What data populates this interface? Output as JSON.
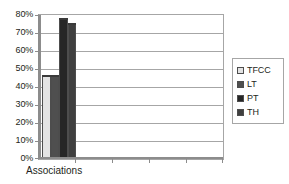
{
  "chart_data": {
    "type": "bar",
    "title": "",
    "subtitle": "",
    "xlabel": "Associations",
    "ylabel": "",
    "categories": [
      "Associations"
    ],
    "series": [
      {
        "name": "TFCC",
        "values": [
          47
        ],
        "color": "#e3e3e3"
      },
      {
        "name": "LT",
        "values": [
          47
        ],
        "color": "#4f4f4f"
      },
      {
        "name": "PT",
        "values": [
          79
        ],
        "color": "#262626"
      },
      {
        "name": "TH",
        "values": [
          76
        ],
        "color": "#3f3f3f"
      }
    ],
    "ylim": [
      0,
      80
    ],
    "ytick_values": [
      0,
      10,
      20,
      30,
      40,
      50,
      60,
      70,
      80
    ],
    "ytick_labels": [
      "0%",
      "10%",
      "20%",
      "30%",
      "40%",
      "50%",
      "60%",
      "70%",
      "80%"
    ],
    "grid": true,
    "grid_axis": "y",
    "legend_position": "right",
    "value_format": "percent",
    "category_slots": 5
  },
  "legend": {
    "entries": [
      {
        "label": "TFCC",
        "swatch_name": "legend-swatch-tfcc"
      },
      {
        "label": "LT",
        "swatch_name": "legend-swatch-lt"
      },
      {
        "label": "PT",
        "swatch_name": "legend-swatch-pt"
      },
      {
        "label": "TH",
        "swatch_name": "legend-swatch-th"
      }
    ]
  },
  "colors": {
    "background": "#ffffff",
    "axis": "#8c8c8c",
    "gridline": "#a6a6a6",
    "text": "#231f20",
    "bar_outline": "#4d4d4d"
  }
}
